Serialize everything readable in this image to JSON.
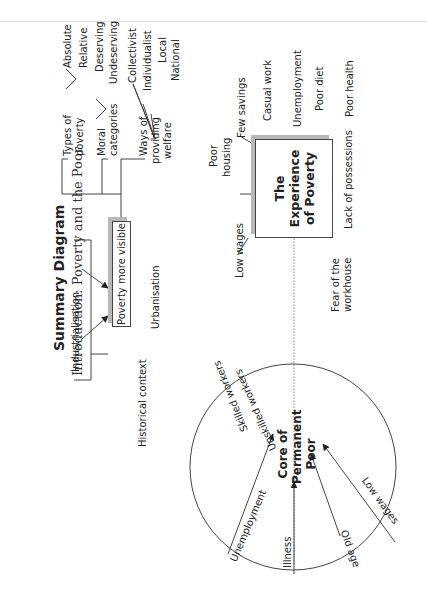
{
  "header": {
    "title": "Summary Diagram",
    "subtitle": "Introduction: Poverty and the Poor"
  },
  "historical_context": {
    "label": "Historical context",
    "causes": [
      "Industrialisation",
      "Urbanisation"
    ],
    "center_box": "Poverty more visible"
  },
  "concepts": [
    {
      "label_lines": [
        "Types of",
        "poverty"
      ],
      "children": [
        "Absolute",
        "Relative"
      ]
    },
    {
      "label_lines": [
        "Moral",
        "categories"
      ],
      "children": [
        "Deserving",
        "Undeserving"
      ]
    },
    {
      "label_lines": [
        "Ways of",
        "providing",
        "welfare"
      ],
      "children": [
        "Collectivist",
        "Individualist",
        "Local",
        "National"
      ]
    }
  ],
  "experience": {
    "box_lines": [
      "The",
      "Experience",
      "of Poverty"
    ],
    "factors": {
      "low_wages": "Low wages",
      "poor_housing_lines": [
        "Poor",
        "housing"
      ],
      "few_savings": "Few savings",
      "casual_work": "Casual work",
      "unemployment": "Unemployment",
      "poor_diet": "Poor diet",
      "poor_health": "Poor health",
      "lack_of_possessions": "Lack of possessions",
      "fear_workhouse_lines": [
        "Fear of the",
        "workhouse"
      ]
    }
  },
  "core_poor": {
    "center_lines": [
      "Core of",
      "Permanent",
      "Poor"
    ],
    "rings": [
      "Skilled workers",
      "Unskilled workers"
    ],
    "inputs": [
      "Unemployment",
      "Illness",
      "Old age",
      "Low wages"
    ]
  }
}
